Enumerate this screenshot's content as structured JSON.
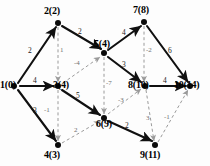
{
  "figure": {
    "type": "directed-graph-diagram"
  },
  "colors": {
    "solid_edge": "#101010",
    "dashed_edge": "#9a9a9a",
    "node": "#0a0a0a",
    "label_text": "#000000",
    "background": "#fdfdfd"
  },
  "nodes": [
    {
      "id": "n1",
      "label": "1(0)",
      "index": "1",
      "value": "0",
      "cx": 14,
      "cy": 86,
      "label_x": 0,
      "label_y": 80
    },
    {
      "id": "n2",
      "label": "2(2)",
      "index": "2",
      "value": "2",
      "cx": 58,
      "cy": 23,
      "label_x": 44,
      "label_y": 6
    },
    {
      "id": "n3",
      "label": "3(4)",
      "index": "3",
      "value": "4",
      "cx": 58,
      "cy": 86,
      "label_x": 53,
      "label_y": 80
    },
    {
      "id": "n4",
      "label": "4(3)",
      "index": "4",
      "value": "3",
      "cx": 58,
      "cy": 145,
      "label_x": 44,
      "label_y": 150
    },
    {
      "id": "n5",
      "label": "5(4)",
      "index": "5",
      "value": "4",
      "cx": 104,
      "cy": 53,
      "label_x": 94,
      "label_y": 39
    },
    {
      "id": "n6",
      "label": "6(9)",
      "index": "6",
      "value": "9",
      "cx": 104,
      "cy": 118,
      "label_x": 96,
      "label_y": 119
    },
    {
      "id": "n7",
      "label": "7(8)",
      "index": "7",
      "value": "8",
      "cx": 144,
      "cy": 22,
      "label_x": 133,
      "label_y": 5
    },
    {
      "id": "n8",
      "label": "8(10)",
      "index": "8",
      "value": "10",
      "cx": 145,
      "cy": 86,
      "label_x": 128,
      "label_y": 80
    },
    {
      "id": "n9",
      "label": "9(11)",
      "index": "9",
      "value": "11",
      "cx": 155,
      "cy": 145,
      "label_x": 140,
      "label_y": 150
    },
    {
      "id": "n10",
      "label": "10(14)",
      "index": "10",
      "value": "14",
      "cx": 190,
      "cy": 86,
      "label_x": 174,
      "label_y": 80
    }
  ],
  "edges_solid": [
    {
      "from": "1",
      "to": "2",
      "weight": "2",
      "x1": 18,
      "y1": 83,
      "x2": 56,
      "y2": 27,
      "label_x": 28,
      "label_y": 47
    },
    {
      "from": "1",
      "to": "3",
      "weight": "4",
      "x1": 20,
      "y1": 86,
      "x2": 54,
      "y2": 86,
      "label_x": 33,
      "label_y": 77
    },
    {
      "from": "1",
      "to": "4",
      "weight": "3",
      "x1": 18,
      "y1": 90,
      "x2": 56,
      "y2": 141,
      "label_x": 33,
      "label_y": 107
    },
    {
      "from": "2",
      "to": "5",
      "weight": "2",
      "x1": 62,
      "y1": 26,
      "x2": 101,
      "y2": 49,
      "label_x": 78,
      "label_y": 28
    },
    {
      "from": "3",
      "to": "6",
      "weight": "5",
      "x1": 62,
      "y1": 90,
      "x2": 100,
      "y2": 115,
      "label_x": 76,
      "label_y": 92
    },
    {
      "from": "5",
      "to": "7",
      "weight": "4",
      "x1": 108,
      "y1": 50,
      "x2": 141,
      "y2": 26,
      "label_x": 122,
      "label_y": 29
    },
    {
      "from": "5",
      "to": "8",
      "weight": "3",
      "x1": 108,
      "y1": 57,
      "x2": 141,
      "y2": 82,
      "label_x": 122,
      "label_y": 61
    },
    {
      "from": "6",
      "to": "9",
      "weight": "2",
      "x1": 108,
      "y1": 121,
      "x2": 152,
      "y2": 141,
      "label_x": 125,
      "label_y": 122
    },
    {
      "from": "7",
      "to": "10",
      "weight": "6",
      "x1": 147,
      "y1": 26,
      "x2": 188,
      "y2": 82,
      "label_x": 168,
      "label_y": 47
    },
    {
      "from": "8",
      "to": "10",
      "weight": "4",
      "x1": 150,
      "y1": 86,
      "x2": 186,
      "y2": 86,
      "label_x": 163,
      "label_y": 77
    }
  ],
  "edges_dashed": [
    {
      "from": "2",
      "to": "3",
      "weight": "1",
      "x1": 58,
      "y1": 27,
      "x2": 58,
      "y2": 82,
      "label_x": 60,
      "label_y": 47
    },
    {
      "from": "3",
      "to": "4",
      "weight": "-1",
      "x1": 58,
      "y1": 90,
      "x2": 58,
      "y2": 141,
      "label_x": 44,
      "label_y": 107
    },
    {
      "from": "3",
      "to": "5",
      "weight": "-4",
      "x1": 63,
      "y1": 83,
      "x2": 100,
      "y2": 57,
      "label_x": 74,
      "label_y": 60
    },
    {
      "from": "5",
      "to": "6",
      "weight": "-7",
      "x1": 104,
      "y1": 57,
      "x2": 104,
      "y2": 114,
      "label_x": 106,
      "label_y": 80
    },
    {
      "from": "4",
      "to": "6",
      "weight": "2",
      "x1": 62,
      "y1": 143,
      "x2": 100,
      "y2": 121,
      "label_x": 74,
      "label_y": 127
    },
    {
      "from": "6",
      "to": "8",
      "weight": "-3",
      "x1": 108,
      "y1": 114,
      "x2": 141,
      "y2": 89,
      "label_x": 118,
      "label_y": 97
    },
    {
      "from": "7",
      "to": "8",
      "weight": "-2",
      "x1": 144,
      "y1": 26,
      "x2": 144,
      "y2": 82,
      "label_x": 146,
      "label_y": 47
    },
    {
      "from": "8",
      "to": "9",
      "weight": "3",
      "x1": 146,
      "y1": 90,
      "x2": 154,
      "y2": 141,
      "label_x": 146,
      "label_y": 115
    },
    {
      "from": "9",
      "to": "10",
      "weight": "-1",
      "x1": 158,
      "y1": 142,
      "x2": 188,
      "y2": 90,
      "label_x": 164,
      "label_y": 114
    }
  ]
}
